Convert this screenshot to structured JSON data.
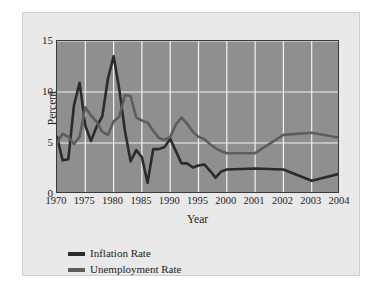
{
  "chart_data": {
    "type": "line",
    "title": "",
    "xlabel": "Year",
    "ylabel": "Percent",
    "ylim": [
      0,
      15
    ],
    "yticks": [
      0,
      5,
      10,
      15
    ],
    "xticks": [
      "1970",
      "1975",
      "1980",
      "1985",
      "1990",
      "1995",
      "2000",
      "2001",
      "2002",
      "2003",
      "2004"
    ],
    "grid": true,
    "legend_position": "below-left",
    "x": [
      1970,
      1971,
      1972,
      1973,
      1974,
      1975,
      1976,
      1977,
      1978,
      1979,
      1980,
      1981,
      1982,
      1983,
      1984,
      1985,
      1986,
      1987,
      1988,
      1989,
      1990,
      1991,
      1992,
      1993,
      1994,
      1995,
      1996,
      1997,
      1998,
      1999,
      2000,
      2001,
      2002,
      2003,
      2004
    ],
    "series": [
      {
        "name": "Inflation Rate",
        "color": "#2b2b2b",
        "values": [
          5.6,
          3.3,
          3.4,
          8.7,
          10.9,
          6.7,
          5.2,
          6.6,
          7.6,
          11.3,
          13.5,
          10.3,
          6.2,
          3.2,
          4.3,
          3.6,
          1.1,
          4.4,
          4.4,
          4.6,
          5.4,
          4.2,
          3.0,
          3.0,
          2.6,
          2.8,
          2.9,
          2.3,
          1.6,
          2.2,
          2.4,
          2.5,
          2.4,
          1.3,
          2.0
        ]
      },
      {
        "name": "Unemployment Rate",
        "color": "#5d5d5d",
        "values": [
          5.0,
          5.9,
          5.6,
          4.9,
          5.6,
          8.5,
          7.7,
          7.1,
          6.1,
          5.8,
          7.1,
          7.6,
          9.7,
          9.6,
          7.5,
          7.2,
          7.0,
          6.2,
          5.5,
          5.3,
          5.6,
          6.8,
          7.5,
          6.9,
          6.1,
          5.6,
          5.4,
          4.9,
          4.5,
          4.2,
          4.0,
          4.0,
          5.8,
          6.0,
          5.5
        ]
      }
    ],
    "plot_background": "#8f8f8f",
    "gridline_color": "#f2f2f2",
    "panel_background": "#e9e9e9"
  },
  "legend": {
    "items": [
      {
        "label": "Inflation Rate"
      },
      {
        "label": "Unemployment Rate"
      }
    ]
  }
}
